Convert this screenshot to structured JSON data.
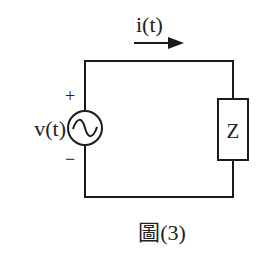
{
  "diagram": {
    "caption": "圖(3)",
    "current_label": "i(t)",
    "source_label": "v(t)",
    "plus_sign": "+",
    "minus_sign": "−",
    "impedance_label": "Z",
    "source_symbol": "ac-voltage-source",
    "colors": {
      "wire": "#1a1a1a",
      "background": "#ffffff"
    }
  }
}
